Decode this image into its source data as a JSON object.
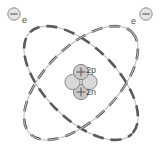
{
  "diagram": {
    "background_color": "#ffffff",
    "orbit_color_primary": "#5a5a5a",
    "orbit_color_secondary": "#b9b9b9",
    "particle_fill": "#cfcfcf",
    "particle_stroke": "#7d7d7d",
    "text_color": "#4d4d4d"
  },
  "labels": {
    "electron_left": "e",
    "electron_right": "e",
    "protons": "2p",
    "neutrons": "2n"
  },
  "icons": {
    "electron_left": "electron-minus-icon",
    "electron_right": "electron-minus-icon",
    "proton_top": "proton-plus-icon",
    "proton_bottom": "proton-plus-icon",
    "neutron_left": "neutron-icon",
    "neutron_right": "neutron-icon"
  },
  "geometry": {
    "width": 162,
    "height": 166,
    "center_x": 81,
    "center_y": 83,
    "orbit_rx": 72,
    "orbit_ry": 36,
    "orbit_rotation_a": -45,
    "orbit_rotation_b": 45,
    "electron_left_x": 14,
    "electron_left_y": 14,
    "electron_right_x": 146,
    "electron_right_y": 14,
    "electron_radius": 6,
    "nucleus_particle_radius": 7.5
  }
}
